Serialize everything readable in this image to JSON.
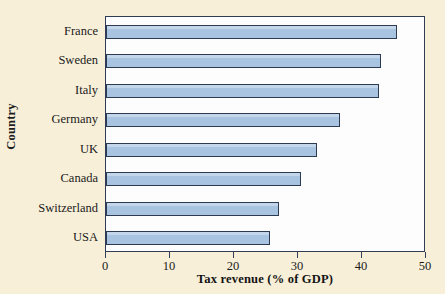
{
  "chart_data": {
    "type": "bar",
    "orientation": "horizontal",
    "title": "",
    "xlabel": "Tax revenue (% of GDP)",
    "ylabel": "Country",
    "categories": [
      "France",
      "Sweden",
      "Italy",
      "Germany",
      "UK",
      "Canada",
      "Switzerland",
      "USA"
    ],
    "values": [
      45.5,
      43.0,
      42.7,
      36.5,
      33.0,
      30.5,
      27.1,
      25.7
    ],
    "xlim": [
      0,
      50
    ],
    "xticks": [
      0,
      10,
      20,
      30,
      40,
      50
    ],
    "xtick_labels": [
      "0",
      "10",
      "20",
      "30",
      "40",
      "50"
    ],
    "grid": false,
    "legend": null,
    "series": [
      {
        "name": "Tax revenue (% of GDP)",
        "values": [
          45.5,
          43.0,
          42.7,
          36.5,
          33.0,
          30.5,
          27.1,
          25.7
        ]
      }
    ],
    "bar_fill_color": "#a8c4e0",
    "bar_edge_color": "#2c3a52",
    "plot_background_color": "#fdfdfd",
    "figure_background_color": "#f7efd8",
    "axis_color": "#2f3c55"
  }
}
